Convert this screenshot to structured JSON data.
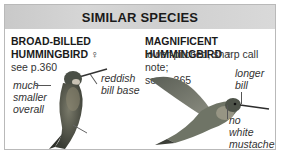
{
  "header": {
    "title": "SIMILAR SPECIES"
  },
  "species": [
    {
      "name_line1": "BROAD-BILLED",
      "name_line2": "HUMMINGBIRD ♀",
      "desc": "see p.360",
      "annotations": {
        "left": [
          "much",
          "smaller",
          "overall"
        ],
        "right": [
          "reddish",
          "bill base"
        ]
      }
    },
    {
      "name_line1": "MAGNIFICENT HUMMINGBIRD ♀",
      "desc_line1": "lower-pitched, sharp call note;",
      "desc_line2": "see p.365",
      "annotations": {
        "top": [
          "longer",
          "bill"
        ],
        "bottom": [
          "no",
          "white",
          "mustache"
        ]
      }
    }
  ],
  "colors": {
    "header_bg": "#d0d0d0",
    "border": "#b9b9b9",
    "text": "#1a1a1a"
  }
}
